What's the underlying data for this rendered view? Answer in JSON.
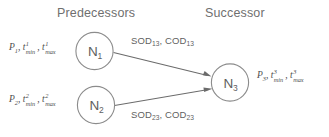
{
  "diagram": {
    "title_columns": {
      "predecessors": "Predecessors",
      "successor": "Successor"
    },
    "nodes": [
      {
        "id": "N1",
        "base": "N",
        "subscript": "1",
        "group": "predecessor",
        "param_label": "P1, t1min, t1max",
        "param_parts": {
          "p_base": "P",
          "p_sub": "1",
          "comma1": ",",
          "t_base": "t",
          "t_sup": "1",
          "t_sub": "min",
          "comma2": ",",
          "t2_base": "t",
          "t2_sup": "1",
          "t2_sub": "max"
        }
      },
      {
        "id": "N2",
        "base": "N",
        "subscript": "2",
        "group": "predecessor",
        "param_label": "P2, t2min, t2max",
        "param_parts": {
          "p_base": "P",
          "p_sub": "2",
          "comma1": ",",
          "t_base": "t",
          "t_sup": "2",
          "t_sub": "min",
          "comma2": ",",
          "t2_base": "t",
          "t2_sup": "2",
          "t2_sub": "max"
        }
      },
      {
        "id": "N3",
        "base": "N",
        "subscript": "3",
        "group": "successor",
        "param_label": "P3, t3min, t3max",
        "param_parts": {
          "p_base": "P",
          "p_sub": "3",
          "comma1": ",",
          "t_base": "t",
          "t_sup": "3",
          "t_sub": "min",
          "comma2": ",",
          "t2_base": "t",
          "t2_sup": "3",
          "t2_sub": "max"
        }
      }
    ],
    "edges": [
      {
        "id": "edge-13",
        "from": "N1",
        "to": "N3",
        "label_parts": {
          "sod_base": "SOD",
          "sod_sub": "13",
          "comma": ",",
          "cod_base": "COD",
          "cod_sub": "13"
        }
      },
      {
        "id": "edge-23",
        "from": "N2",
        "to": "N3",
        "label_parts": {
          "sod_base": "SOD",
          "sod_sub": "23",
          "comma": ",",
          "cod_base": "COD",
          "cod_sub": "23"
        }
      }
    ],
    "colors": {
      "background": "#ffffff",
      "node_stroke": "#8c8c8c",
      "node_text": "#5e5e5e",
      "edge_stroke": "#6b6b6b",
      "heading_text": "#6f6f6f",
      "label_text": "#4d4d4d"
    }
  }
}
